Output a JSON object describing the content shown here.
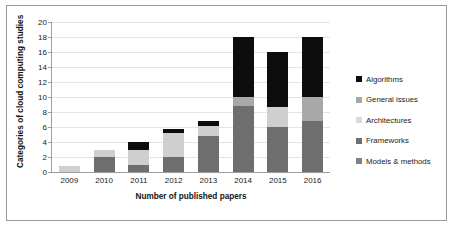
{
  "chart_data": {
    "type": "bar",
    "title": "",
    "subtitle": "",
    "xlabel": "Number of published papers",
    "ylabel": "Categories of cloud computing studies",
    "categories": [
      "2009",
      "2010",
      "2011",
      "2012",
      "2013",
      "2014",
      "2015",
      "2016"
    ],
    "ylim": [
      0,
      20
    ],
    "yticks": [
      0,
      2,
      4,
      6,
      8,
      10,
      12,
      14,
      16,
      18,
      20
    ],
    "grid": true,
    "stacked": true,
    "legend_position": "right",
    "series": [
      {
        "name": "Models & methods",
        "color": "#767676",
        "values": [
          0,
          0,
          0,
          0,
          0,
          0,
          0,
          0
        ]
      },
      {
        "name": "Frameworks",
        "color": "#6e6e6e",
        "values": [
          0,
          2,
          1,
          2,
          4.8,
          8.8,
          6,
          6.8
        ]
      },
      {
        "name": "Architectures",
        "color": "#cfcfcf",
        "values": [
          0.8,
          1,
          2,
          3.2,
          1.3,
          0,
          2.7,
          0
        ]
      },
      {
        "name": "General issues",
        "color": "#a8a8a8",
        "values": [
          0,
          0,
          0,
          0,
          0,
          1.2,
          0,
          3.2
        ]
      },
      {
        "name": "Algorithms",
        "color": "#0d0d0d",
        "values": [
          0,
          0,
          1,
          0.6,
          0.7,
          8,
          7.3,
          8
        ]
      }
    ],
    "totals": [
      0.8,
      3,
      4,
      5.8,
      6.8,
      18,
      16,
      18
    ]
  },
  "legend": {
    "items": [
      {
        "label": "Algorithms",
        "color": "#0d0d0d"
      },
      {
        "label": "General issues",
        "color": "#a8a8a8"
      },
      {
        "label": "Architectures",
        "color": "#d9d9d9"
      },
      {
        "label": "Frameworks",
        "color": "#6e6e6e"
      },
      {
        "label": "Models & methods",
        "color": "#808080"
      }
    ]
  },
  "colors": {
    "frame_border": "#9a9a9a",
    "axis": "#9e9e9e",
    "gridline": "#e4e4e4",
    "background": "#ffffff",
    "text": "#1a1a1a"
  }
}
